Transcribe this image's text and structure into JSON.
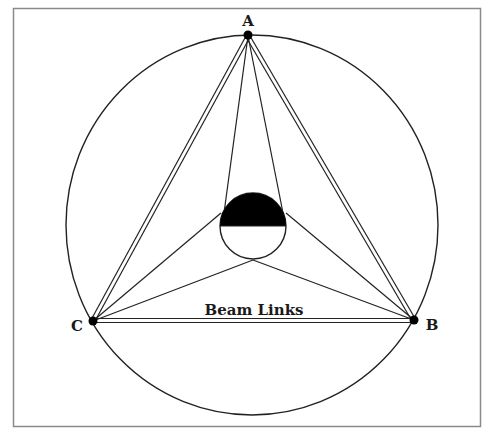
{
  "diagram": {
    "title": "Beam Links",
    "frame": {
      "x": 13,
      "y": 8,
      "width": 467,
      "height": 418,
      "stroke": "#8a8a8a"
    },
    "outer_circle": {
      "cx": 252,
      "cy": 225,
      "rx": 186,
      "ry": 190
    },
    "inner_circle": {
      "cx": 253,
      "cy": 226,
      "r": 33,
      "fill_top": "#000000"
    },
    "nodes": [
      {
        "id": "A",
        "label": "A",
        "x": 248,
        "y": 35,
        "label_x": 248,
        "label_y": 24
      },
      {
        "id": "B",
        "label": "B",
        "x": 414,
        "y": 320,
        "label_x": 432,
        "label_y": 329
      },
      {
        "id": "C",
        "label": "C",
        "x": 93,
        "y": 321,
        "label_x": 77,
        "label_y": 330
      }
    ],
    "beam_links": [
      {
        "from": "A",
        "to": "B",
        "style": "double"
      },
      {
        "from": "A",
        "to": "C",
        "style": "double"
      },
      {
        "from": "C",
        "to": "B",
        "style": "double"
      }
    ],
    "center_links": [
      {
        "from": "A",
        "to_point": [
          224,
          213
        ]
      },
      {
        "from": "A",
        "to_point": [
          283,
          213
        ]
      },
      {
        "from": "C",
        "to_point": [
          221,
          213
        ]
      },
      {
        "from": "C",
        "to_point": [
          253,
          260
        ]
      },
      {
        "from": "B",
        "to_point": [
          286,
          213
        ]
      },
      {
        "from": "B",
        "to_point": [
          253,
          260
        ]
      }
    ],
    "beam_label": {
      "text": "Beam Links",
      "x": 254,
      "y": 315
    }
  }
}
